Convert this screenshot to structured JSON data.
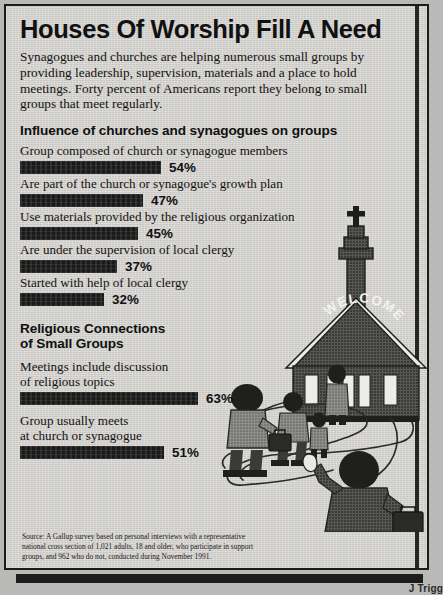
{
  "headline": "Houses Of Worship Fill A Need",
  "intro": "Synagogues and churches are helping numerous small groups by providing leadership, supervision, materials and a place to hold meetings. Forty percent of Americans report they belong to small groups that meet regularly.",
  "illustration": {
    "church_sign_text": "WELCOME",
    "alt": "church-with-steeple-and-people-on-open-hand"
  },
  "source_note": "Source: A Gallup survey based on personal interviews with a representative national cross section of 1,021 adults, 18 and older, who participate in support groups, and 962 who do not, conducted during November 1991.",
  "credit": "J Trigg",
  "chart_data": [
    {
      "type": "bar",
      "title": "Influence of churches and synagogues on groups",
      "orientation": "horizontal",
      "unit": "%",
      "xlabel": "",
      "ylabel": "",
      "xlim": [
        0,
        100
      ],
      "grid": false,
      "legend": false,
      "categories": [
        "Group composed of church or synagogue members",
        "Are part of the church or synagogue's growth plan",
        "Use materials provided by the religious organization",
        "Are under the supervision of local clergy",
        "Started with help of local clergy"
      ],
      "values": [
        54,
        47,
        45,
        37,
        32
      ],
      "value_labels": [
        "54%",
        "47%",
        "45%",
        "37%",
        "32%"
      ]
    },
    {
      "type": "bar",
      "title": "Religious Connections of Small Groups",
      "orientation": "horizontal",
      "unit": "%",
      "xlabel": "",
      "ylabel": "",
      "xlim": [
        0,
        100
      ],
      "grid": false,
      "legend": false,
      "categories": [
        "Meetings include discussion of religious topics",
        "Group usually meets at church or synagogue"
      ],
      "values": [
        63,
        51
      ],
      "value_labels": [
        "63%",
        "51%"
      ]
    }
  ],
  "section1": {
    "heading": "Influence of churches and synagogues on groups",
    "bars": [
      {
        "label": "Group composed of church or synagogue members",
        "value": "54%",
        "width": 141
      },
      {
        "label": "Are part of the church or synagogue's growth plan",
        "value": "47%",
        "width": 123
      },
      {
        "label": "Use materials provided by the religious organization",
        "value": "45%",
        "width": 118
      },
      {
        "label": "Are under the supervision of local clergy",
        "value": "37%",
        "width": 97
      },
      {
        "label": "Started with help of local clergy",
        "value": "32%",
        "width": 84
      }
    ]
  },
  "section2": {
    "heading_line1": "Religious Connections",
    "heading_line2": "of Small Groups",
    "bars": [
      {
        "label_line1": "Meetings include discussion",
        "label_line2": "of religious topics",
        "value": "63%",
        "width": 178
      },
      {
        "label_line1": "Group usually meets",
        "label_line2": "at church or synagogue",
        "value": "51%",
        "width": 144
      }
    ]
  }
}
